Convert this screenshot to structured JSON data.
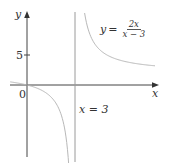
{
  "chart_data": {
    "type": "line",
    "title": "",
    "function": "y = 2x/(x-3)",
    "xlabel": "x",
    "ylabel": "y",
    "xlim": [
      -1.05,
      8.2
    ],
    "ylim": [
      -13,
      12.2
    ],
    "origin_label": "0",
    "y_ticks": [
      {
        "value": 5,
        "label": "5"
      }
    ],
    "x_ticks": [],
    "grid": false,
    "legend": null,
    "asymptotes": [
      {
        "type": "vertical",
        "x": 3,
        "label": "x = 3"
      },
      {
        "type": "horizontal",
        "y": 2,
        "label": "",
        "drawn": false
      }
    ],
    "series": [
      {
        "name": "left branch",
        "color": "#b8b8b8",
        "x": [
          -1.0,
          -0.5,
          0,
          0.5,
          1.0,
          1.5,
          2.0,
          2.3,
          2.5,
          2.6,
          2.65
        ],
        "y": [
          0.5,
          0.29,
          0,
          -0.4,
          -1.0,
          -2.0,
          -4.0,
          -6.57,
          -10.0,
          -13.0,
          -15.14
        ]
      },
      {
        "name": "right branch",
        "color": "#b8b8b8",
        "x": [
          3.6,
          3.8,
          4.0,
          4.5,
          5.0,
          5.5,
          6.0,
          7.0,
          8.0
        ],
        "y": [
          12.0,
          9.5,
          8.0,
          6.0,
          5.0,
          4.4,
          4.0,
          3.5,
          3.2
        ]
      }
    ],
    "annotations": [
      {
        "text": "y = 2x/(x − 3)",
        "position": "upper right",
        "near": "right branch"
      },
      {
        "text": "x = 3",
        "position": "below x-axis, right of asymptote"
      }
    ]
  },
  "labels": {
    "y_axis": "y",
    "x_axis": "x",
    "origin": "0",
    "tick_5": "5",
    "asymptote": "x = 3",
    "equation_lhs": "y",
    "equation_eq": "=",
    "equation_num": "2x",
    "equation_den": "x − 3"
  },
  "colors": {
    "axis": "#333333",
    "curve": "#b8b8b8",
    "asymptote": "#9a9a9a",
    "text": "#333333"
  }
}
